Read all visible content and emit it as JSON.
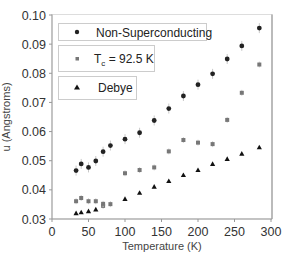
{
  "chart_data": {
    "type": "scatter",
    "title": "",
    "xlabel": "Temperature (K)",
    "ylabel": "u (Angstroms)",
    "xlim": [
      0,
      300
    ],
    "ylim": [
      0.03,
      0.1
    ],
    "xticks": [
      0,
      50,
      100,
      150,
      200,
      250,
      300
    ],
    "yticks": [
      0.03,
      0.04,
      0.05,
      0.06,
      0.07,
      0.08,
      0.09,
      0.1
    ],
    "ytick_labels": [
      "0.03",
      "0.04",
      "0.05",
      "0.06",
      "0.07",
      "0.08",
      "0.09",
      "0.10"
    ],
    "grid": false,
    "legend_position": "upper-left",
    "series": [
      {
        "name": "Non-Superconducting",
        "marker": "circle",
        "color": "#222222",
        "x": [
          33,
          40,
          50,
          60,
          70,
          80,
          100,
          120,
          140,
          160,
          180,
          200,
          220,
          240,
          260,
          284
        ],
        "y": [
          0.0466,
          0.0489,
          0.0477,
          0.0499,
          0.0531,
          0.0552,
          0.0574,
          0.0596,
          0.0638,
          0.0679,
          0.0722,
          0.0761,
          0.0798,
          0.0849,
          0.0894,
          0.0955
        ]
      },
      {
        "name": "T_c = 92.5 K",
        "marker": "square",
        "color": "#777777",
        "x": [
          33,
          40,
          50,
          60,
          70,
          70,
          80,
          100,
          120,
          140,
          160,
          180,
          200,
          220,
          240,
          260,
          284
        ],
        "y": [
          0.0361,
          0.0372,
          0.0361,
          0.0361,
          0.0345,
          0.0352,
          0.0351,
          0.0457,
          0.0468,
          0.0477,
          0.0532,
          0.0571,
          0.0562,
          0.0557,
          0.064,
          0.0733,
          0.083
        ]
      },
      {
        "name": "Debye",
        "marker": "triangle",
        "color": "#111111",
        "x": [
          33,
          40,
          50,
          60,
          100,
          120,
          140,
          160,
          180,
          200,
          220,
          240,
          260,
          284
        ],
        "y": [
          0.032,
          0.0323,
          0.0327,
          0.0333,
          0.0369,
          0.039,
          0.0411,
          0.043,
          0.0451,
          0.0468,
          0.0489,
          0.0506,
          0.0524,
          0.0546
        ]
      }
    ]
  },
  "legend": {
    "item1": "Non-Superconducting",
    "item2_main": "T",
    "item2_sub": "c",
    "item2_rest": " = 92.5 K",
    "item3": "Debye"
  },
  "axes": {
    "xlabel": "Temperature (K)",
    "ylabel": "u (Angstroms)"
  },
  "colors": {
    "axis": "#999999",
    "frame": "#cccccc",
    "errorbar": "#bbbbbb"
  }
}
